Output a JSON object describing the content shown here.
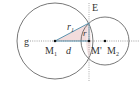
{
  "diagram": {
    "type": "two-circle intersection",
    "labels": {
      "line_g": "g",
      "center1": "M",
      "center1_sub": "1",
      "center2": "M",
      "center2_sub": "2",
      "foot_point": "M'",
      "distance": "d",
      "radius1": "r",
      "radius1_sub": "1",
      "radius_chord": "r",
      "intersection": "E"
    },
    "colors": {
      "circle_stroke": "#555555",
      "dotted_line": "#777777",
      "segment_stroke": "#4a8aa8",
      "triangle_fill": "#f3dcdc",
      "point_fill": "#111111"
    }
  }
}
